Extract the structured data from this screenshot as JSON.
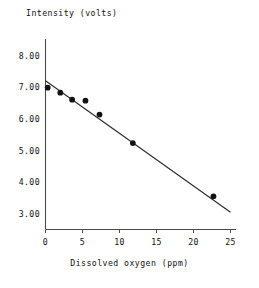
{
  "chart_data": {
    "type": "scatter",
    "title": "",
    "xlabel": "Dissolved oxygen (ppm)",
    "ylabel": "Intensity (volts)",
    "xlim": [
      0,
      25
    ],
    "ylim": [
      3.0,
      8.0
    ],
    "xticks": [
      0,
      5,
      10,
      15,
      20,
      25
    ],
    "xtick_labels": [
      "0",
      "5",
      "10",
      "15",
      "20",
      "25"
    ],
    "yticks": [
      3.0,
      4.0,
      5.0,
      6.0,
      7.0,
      8.0
    ],
    "ytick_labels": [
      "3.00",
      "4.00",
      "5.00",
      "6.00",
      "7.00",
      "8.00"
    ],
    "grid": false,
    "legend": false,
    "series": [
      {
        "name": "Measurements",
        "marker": "filled-circle",
        "color": "#121212",
        "x": [
          0.3,
          2.0,
          3.6,
          5.4,
          7.3,
          11.8,
          22.7
        ],
        "y": [
          6.98,
          6.82,
          6.6,
          6.57,
          6.13,
          5.23,
          3.55
        ]
      },
      {
        "name": "Least-squares fit",
        "type": "line",
        "color": "#2b2b2b",
        "x": [
          0.0,
          25.0
        ],
        "y": [
          7.2,
          3.05
        ]
      }
    ],
    "annotations": []
  },
  "axes": {
    "y_title": "Intensity (volts)",
    "x_title": "Dissolved oxygen (ppm)"
  }
}
